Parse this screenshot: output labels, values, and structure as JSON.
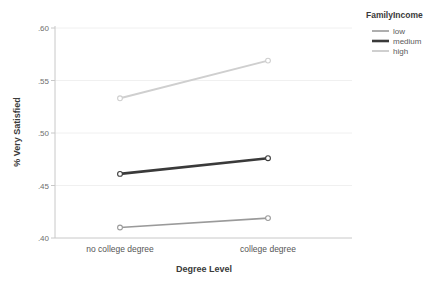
{
  "chart_data": {
    "type": "line",
    "title": "",
    "xlabel": "Degree Level",
    "ylabel": "% Very Satisfied",
    "categories": [
      "no college degree",
      "college degree"
    ],
    "ylim": [
      0.4,
      0.6
    ],
    "yticks": [
      ".40",
      ".45",
      ".50",
      ".55",
      ".60"
    ],
    "ytick_values": [
      0.4,
      0.45,
      0.5,
      0.55,
      0.6
    ],
    "grid": true,
    "grid_axis": "y",
    "legend_position": "right-top",
    "legend_title": "FamilyIncome",
    "markers": "open-circle",
    "series": [
      {
        "name": "low",
        "values": [
          0.41,
          0.419
        ],
        "color": "#9a9a9a",
        "width": 1.6
      },
      {
        "name": "medium",
        "values": [
          0.461,
          0.476
        ],
        "color": "#3a3a3a",
        "width": 2.6
      },
      {
        "name": "high",
        "values": [
          0.533,
          0.569
        ],
        "color": "#cfcfcf",
        "width": 2.0
      }
    ]
  },
  "axes": {
    "y_title": "% Very Satisfied",
    "x_title": "Degree Level",
    "y_tick_0": ".40",
    "y_tick_1": ".45",
    "y_tick_2": ".50",
    "y_tick_3": ".55",
    "y_tick_4": ".60",
    "x_cat_0": "no college degree",
    "x_cat_1": "college degree"
  },
  "legend": {
    "title": "FamilyIncome",
    "item_0": "low",
    "item_1": "medium",
    "item_2": "high"
  },
  "colors": {
    "background": "#ffffff",
    "axis_line": "#c8c8c8",
    "grid_line": "#f0f0f0",
    "series_low": "#9a9a9a",
    "series_medium": "#3a3a3a",
    "series_high": "#cfcfcf",
    "text": "#4a4a4a"
  }
}
